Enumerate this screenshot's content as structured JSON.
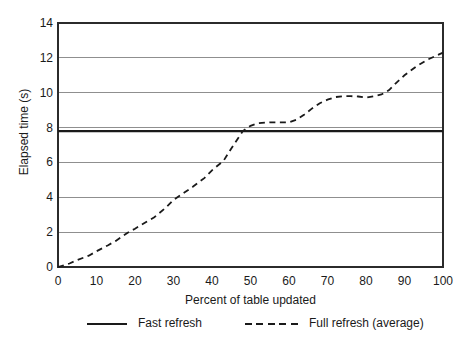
{
  "colors": {
    "background": "#ffffff",
    "axis": "#2b2b2b",
    "grid": "#8f8f8f",
    "series": "#1a1a1a",
    "text": "#1a1a1a"
  },
  "chart_data": {
    "type": "line",
    "xlabel": "Percent of table updated",
    "ylabel": "Elapsed time (s)",
    "xlim": [
      0,
      100
    ],
    "ylim": [
      0,
      14
    ],
    "xticks": [
      0,
      10,
      20,
      30,
      40,
      50,
      60,
      70,
      80,
      90,
      100
    ],
    "yticks": [
      0,
      2,
      4,
      6,
      8,
      10,
      12,
      14
    ],
    "grid": "horizontal-only",
    "legend_position": "bottom",
    "series": [
      {
        "name": "Fast refresh",
        "line_style": "solid",
        "color": "#1a1a1a",
        "x": [
          0,
          100
        ],
        "y": [
          7.8,
          7.8
        ]
      },
      {
        "name": "Full refresh (average)",
        "line_style": "dashed",
        "color": "#1a1a1a",
        "x": [
          0,
          3,
          5,
          8,
          10,
          13,
          15,
          18,
          20,
          23,
          25,
          28,
          30,
          33,
          35,
          38,
          40,
          43,
          45,
          48,
          50,
          52,
          55,
          58,
          60,
          62,
          64,
          66,
          68,
          70,
          72,
          74,
          76,
          78,
          80,
          82,
          84,
          86,
          88,
          90,
          93,
          96,
          100
        ],
        "y": [
          0,
          0.2,
          0.4,
          0.65,
          0.9,
          1.25,
          1.5,
          1.95,
          2.2,
          2.6,
          2.85,
          3.4,
          3.85,
          4.3,
          4.6,
          5.1,
          5.55,
          6.1,
          6.8,
          7.8,
          8.1,
          8.25,
          8.3,
          8.3,
          8.3,
          8.45,
          8.75,
          9.1,
          9.4,
          9.6,
          9.75,
          9.8,
          9.8,
          9.78,
          9.72,
          9.8,
          9.9,
          10.15,
          10.6,
          11.0,
          11.5,
          11.9,
          12.3
        ]
      }
    ]
  }
}
